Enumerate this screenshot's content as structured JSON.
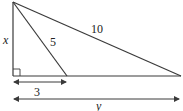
{
  "diagram": {
    "type": "right-triangle-geometry",
    "colors": {
      "stroke": "#3a3a3a",
      "text": "#222222",
      "background": "#ffffff"
    },
    "labels": {
      "height": "x",
      "inner_hypotenuse": "5",
      "outer_hypotenuse": "10",
      "short_base": "3",
      "long_base": "y"
    },
    "right_angle_marker": true
  }
}
